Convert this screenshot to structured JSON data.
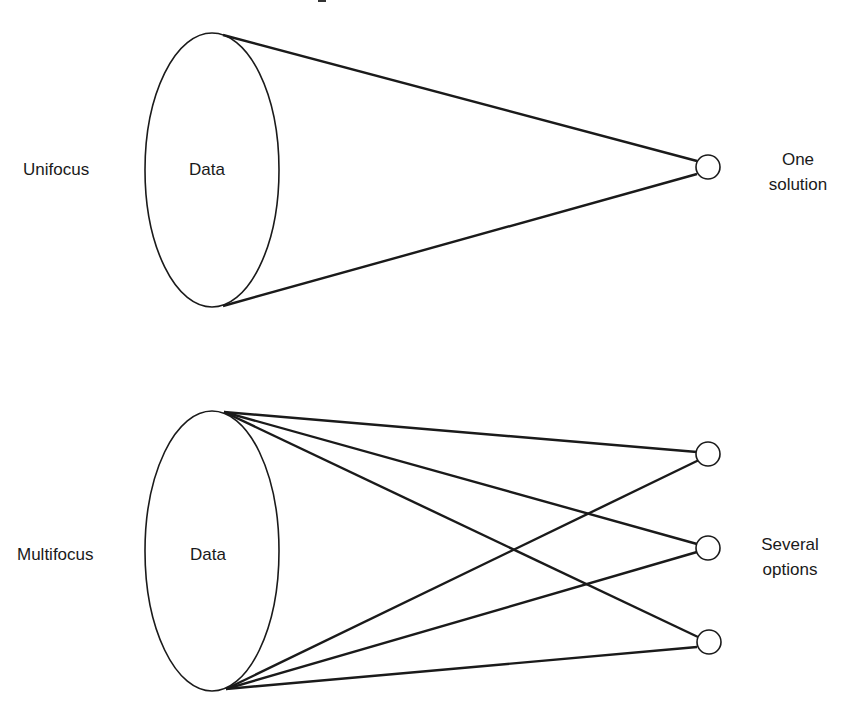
{
  "diagram": {
    "unifocus": {
      "label": "Unifocus",
      "data_label": "Data",
      "outcome_line1": "One",
      "outcome_line2": "solution",
      "outcome_count": 1
    },
    "multifocus": {
      "label": "Multifocus",
      "data_label": "Data",
      "outcome_line1": "Several",
      "outcome_line2": "options",
      "outcome_count": 3
    },
    "colors": {
      "stroke": "#1a1a1a",
      "background": "#ffffff"
    }
  }
}
